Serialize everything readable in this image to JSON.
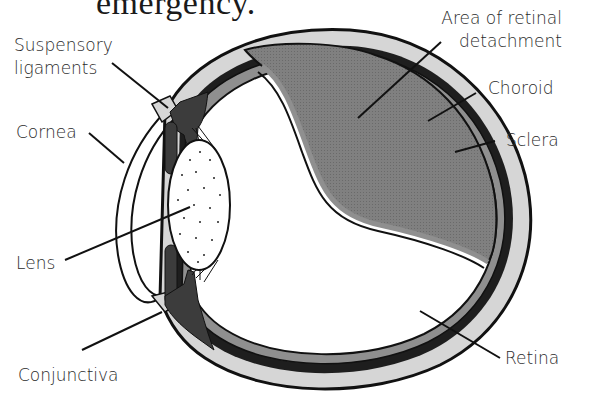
{
  "title": "emergency.",
  "labels": {
    "suspensory_1": "Suspensory",
    "suspensory_2": "ligaments",
    "cornea": "Cornea",
    "lens": "Lens",
    "conjunctiva": "Conjunctiva",
    "area_1": "Area of retinal",
    "area_2": "detachment",
    "choroid": "Choroid",
    "sclera": "Sclera",
    "retina": "Retina"
  },
  "colors": {
    "sclera": "#d6d6d6",
    "choroid": "#1e1e1e",
    "retina": "#8a8a8a",
    "detachment": "#7d7d7d",
    "ciliary": "#3c3c3c",
    "outline": "#111111"
  }
}
